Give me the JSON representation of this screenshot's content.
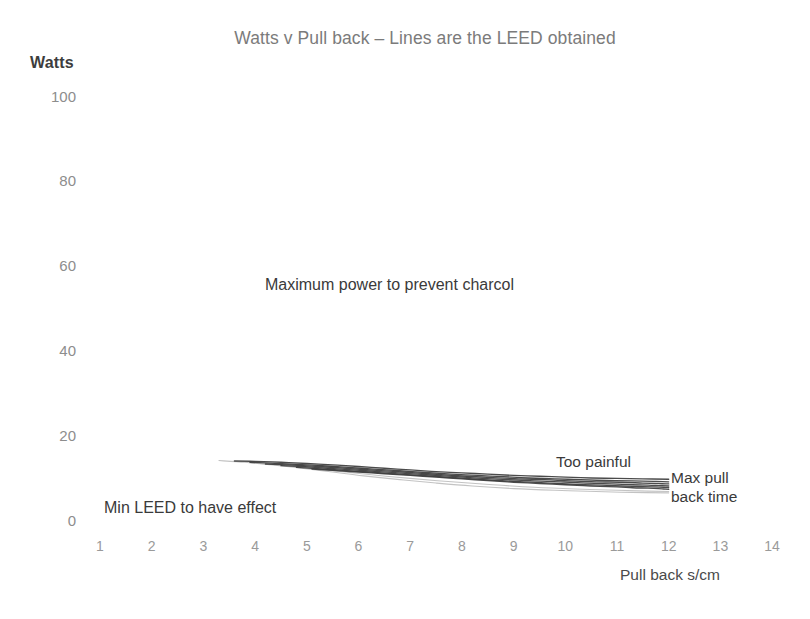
{
  "chart_data": {
    "type": "line",
    "title": "Watts v Pull back – Lines are the LEED obtained",
    "xlabel": "Pull back s/cm",
    "ylabel": "Watts",
    "xlim": [
      0,
      14.5
    ],
    "ylim": [
      0,
      100
    ],
    "grid": false,
    "legend": "none",
    "xticks": [
      "1",
      "2",
      "3",
      "4",
      "5",
      "6",
      "7",
      "8",
      "9",
      "10",
      "11",
      "12",
      "13",
      "14"
    ],
    "xtick_values": [
      1,
      2,
      3,
      4,
      5,
      6,
      7,
      8,
      9,
      10,
      11,
      12,
      13,
      14
    ],
    "yticks": [
      "100",
      "80",
      "60",
      "40",
      "20",
      "0"
    ],
    "ytick_values": [
      100,
      80,
      60,
      40,
      20,
      0
    ],
    "series": [
      {
        "name": "LEED line 1",
        "x": [
          3.6,
          4.0,
          4.5,
          5.0,
          5.5,
          6.0,
          6.5,
          7.0,
          7.5,
          8.0,
          8.5,
          9.0,
          9.5,
          10.0,
          10.5,
          11.0,
          11.5,
          12.0
        ],
        "y": [
          13.9,
          13.8,
          13.6,
          13.3,
          13.0,
          12.6,
          12.2,
          11.8,
          11.4,
          11.1,
          10.8,
          10.5,
          10.3,
          10.1,
          9.9,
          9.8,
          9.7,
          9.6
        ]
      },
      {
        "name": "LEED line 2",
        "x": [
          3.9,
          4.3,
          4.8,
          5.3,
          5.8,
          6.3,
          6.8,
          7.3,
          7.8,
          8.3,
          8.8,
          9.3,
          9.8,
          10.3,
          10.8,
          11.3,
          11.7,
          12.0
        ],
        "y": [
          13.6,
          13.4,
          13.1,
          12.8,
          12.4,
          12.0,
          11.6,
          11.2,
          10.8,
          10.5,
          10.2,
          9.9,
          9.7,
          9.5,
          9.3,
          9.2,
          9.1,
          9.0
        ]
      },
      {
        "name": "LEED line 3",
        "x": [
          4.2,
          4.6,
          5.1,
          5.6,
          6.1,
          6.6,
          7.1,
          7.6,
          8.1,
          8.6,
          9.1,
          9.6,
          10.1,
          10.6,
          11.1,
          11.5,
          11.8,
          12.0
        ],
        "y": [
          13.2,
          13.0,
          12.7,
          12.3,
          11.9,
          11.5,
          11.1,
          10.7,
          10.3,
          10.0,
          9.7,
          9.5,
          9.2,
          9.0,
          8.9,
          8.7,
          8.6,
          8.5
        ]
      },
      {
        "name": "LEED line 4",
        "x": [
          4.5,
          4.9,
          5.4,
          5.9,
          6.4,
          6.9,
          7.4,
          7.9,
          8.4,
          8.9,
          9.4,
          9.9,
          10.4,
          10.9,
          11.3,
          11.6,
          11.8,
          12.0
        ],
        "y": [
          12.8,
          12.6,
          12.2,
          11.8,
          11.4,
          11.0,
          10.6,
          10.2,
          9.8,
          9.5,
          9.2,
          9.0,
          8.7,
          8.5,
          8.3,
          8.2,
          8.1,
          8.0
        ]
      },
      {
        "name": "LEED line 5",
        "x": [
          4.8,
          5.2,
          5.7,
          6.2,
          6.7,
          7.2,
          7.7,
          8.2,
          8.7,
          9.2,
          9.7,
          10.2,
          10.7,
          11.1,
          11.4,
          11.7,
          11.9,
          12.0
        ],
        "y": [
          12.4,
          12.1,
          11.7,
          11.3,
          10.9,
          10.5,
          10.1,
          9.7,
          9.3,
          9.0,
          8.7,
          8.4,
          8.2,
          8.0,
          7.9,
          7.8,
          7.7,
          7.6
        ]
      },
      {
        "name": "LEED line 6",
        "x": [
          5.1,
          5.5,
          6.0,
          6.5,
          7.0,
          7.5,
          8.0,
          8.5,
          9.0,
          9.5,
          10.0,
          10.5,
          11.0,
          11.3,
          11.6,
          11.8,
          11.9,
          12.0
        ],
        "y": [
          12.0,
          11.7,
          11.3,
          10.9,
          10.5,
          10.1,
          9.7,
          9.3,
          8.9,
          8.6,
          8.3,
          8.0,
          7.8,
          7.6,
          7.5,
          7.4,
          7.3,
          7.2
        ]
      }
    ],
    "faint_series": [
      {
        "name": "faint lower sweep 1",
        "x": [
          3.3,
          3.8,
          4.3,
          4.9,
          5.5,
          6.1,
          6.8,
          7.5,
          8.2,
          9.0,
          9.8,
          10.6,
          11.3,
          12.0
        ],
        "y": [
          14.0,
          13.6,
          13.0,
          12.2,
          11.3,
          10.4,
          9.5,
          8.7,
          8.0,
          7.4,
          7.0,
          6.7,
          6.5,
          6.4
        ]
      },
      {
        "name": "faint lower sweep 2",
        "x": [
          3.9,
          4.4,
          5.0,
          5.6,
          6.3,
          7.0,
          7.8,
          8.6,
          9.4,
          10.2,
          11.0,
          11.6,
          12.0
        ],
        "y": [
          13.5,
          13.0,
          12.3,
          11.5,
          10.6,
          9.8,
          9.0,
          8.3,
          7.7,
          7.3,
          7.0,
          6.8,
          6.7
        ]
      }
    ],
    "annotations": [
      {
        "key": "max_power",
        "text": "Maximum power to prevent charcol",
        "x": 4.2,
        "y": 50
      },
      {
        "key": "min_leed",
        "text": "Min LEED to have effect",
        "x": 1.1,
        "y": 3.5
      },
      {
        "key": "too_painful",
        "text": "Too painful",
        "x": 9.9,
        "y": 14.5
      },
      {
        "key": "max_pull_1",
        "text": "Max pull",
        "x": 12.1,
        "y": 12.0
      },
      {
        "key": "max_pull_2",
        "text": "back time",
        "x": 12.1,
        "y": 9.0
      }
    ],
    "colors": {
      "background": "#ffffff",
      "title": "#7b7b7b",
      "tick_label": "#8d8d8d",
      "annotation": "#3a3a3a",
      "line": "#3c3c3c",
      "line_faint": "#b9b9b9"
    }
  }
}
